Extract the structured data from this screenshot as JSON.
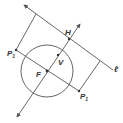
{
  "diagram": {
    "colors": {
      "stroke": "#555555",
      "text": "#333333",
      "background": "#ffffff"
    },
    "labels": {
      "line": "ℓ",
      "vertex_top": "H",
      "vertex": "V",
      "focus": "F",
      "point_upper": "P",
      "point_upper_sub": "1",
      "point_lower": "P",
      "point_lower_sub": "1"
    },
    "points": {
      "F": [
        47,
        71
      ],
      "V": [
        58,
        55
      ],
      "H": [
        69,
        39
      ],
      "P1_upper": [
        16,
        50
      ],
      "P1_lower": [
        79,
        91
      ]
    },
    "circle": {
      "center": "F",
      "radius": 26
    }
  }
}
